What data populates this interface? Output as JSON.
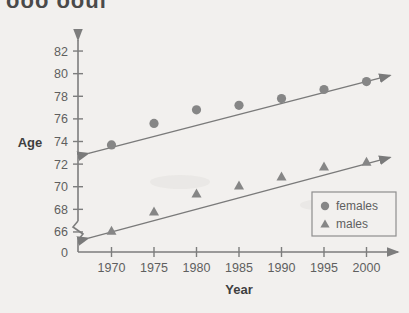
{
  "figure": {
    "clipped_title": "ooo  ooui",
    "background_color": "#f2f0ee",
    "marker_color": "#868686",
    "line_color": "#7a7a7a",
    "axis_color": "#7d7d7d"
  },
  "axis_titles": {
    "x": "Year",
    "y": "Age"
  },
  "y_ticks": [
    "0",
    "66",
    "68",
    "70",
    "72",
    "74",
    "76",
    "78",
    "80",
    "82"
  ],
  "x_ticks": [
    "1970",
    "1975",
    "1980",
    "1985",
    "1990",
    "1995",
    "2000"
  ],
  "legend": {
    "entries": [
      {
        "label": "females",
        "marker": "circle-marker"
      },
      {
        "label": "males",
        "marker": "triangle-marker"
      }
    ]
  },
  "chart_data": {
    "type": "scatter",
    "title": "",
    "xlabel": "Year",
    "ylabel": "Age",
    "x": [
      1970,
      1975,
      1980,
      1985,
      1990,
      1995,
      2000
    ],
    "xlim": [
      1967,
      2003
    ],
    "ylim": [
      65.2,
      82.8
    ],
    "y_axis_break": true,
    "y_break_between": [
      0,
      66
    ],
    "grid": false,
    "legend_position": "lower-right",
    "trendlines": [
      {
        "name": "females",
        "x_start": 1967.3,
        "y_start": 72.95,
        "x_end": 2002.8,
        "y_end": 79.85,
        "arrow_both_ends": true
      },
      {
        "name": "males",
        "x_start": 1967.3,
        "y_start": 65.45,
        "x_end": 2002.8,
        "y_end": 72.6,
        "arrow_both_ends": true
      }
    ],
    "series": [
      {
        "name": "females",
        "marker": "circle",
        "values": [
          73.7,
          75.6,
          76.8,
          77.2,
          77.8,
          78.6,
          79.3
        ]
      },
      {
        "name": "males",
        "marker": "triangle",
        "values": [
          66.1,
          67.8,
          69.4,
          70.1,
          70.9,
          71.8,
          72.2
        ]
      }
    ]
  }
}
